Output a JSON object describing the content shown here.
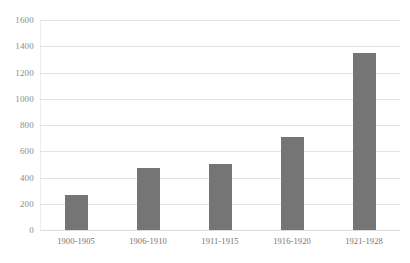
{
  "chart_data": {
    "type": "bar",
    "title": "",
    "subtitle": "",
    "xlabel": "",
    "ylabel": "",
    "categories": [
      "1900-1905",
      "1906-1910",
      "1911-1915",
      "1916-1920",
      "1921-1928"
    ],
    "values": [
      265,
      475,
      505,
      710,
      1350
    ],
    "series": [
      {
        "name": "",
        "values": [
          265,
          475,
          505,
          710,
          1350
        ]
      }
    ],
    "ylim": [
      0,
      1600
    ],
    "yticks": [
      0,
      200,
      400,
      600,
      800,
      1000,
      1200,
      1400,
      1600
    ],
    "ytick_labels": [
      "0",
      "200",
      "400",
      "600",
      "800",
      "1000",
      "1200",
      "1400",
      "1600"
    ],
    "grid": true,
    "grid_axis": "y",
    "legend": false,
    "legend_position": "none",
    "bar_color": "#757575",
    "gridline_color": "#e2e2e2",
    "axis_label_color": "#8c8c8c",
    "background_color": "#ffffff",
    "annotations": []
  }
}
